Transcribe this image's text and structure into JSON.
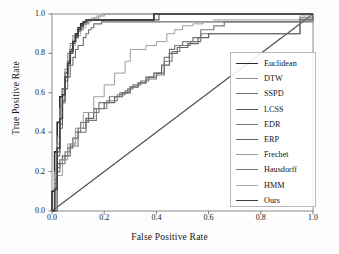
{
  "chart_data": {
    "type": "line",
    "title": "",
    "xlabel": "False Positive Rate",
    "ylabel": "True Positive Rate",
    "xlim": [
      0.0,
      1.0
    ],
    "ylim": [
      0.0,
      1.0
    ],
    "xticks": [
      "0.0",
      "0.2",
      "0.4",
      "0.6",
      "0.8",
      "1.0"
    ],
    "yticks": [
      "0.0",
      "0.2",
      "0.4",
      "0.6",
      "0.8",
      "1.0"
    ],
    "grid": false,
    "legend_position": "right",
    "reference_line": {
      "name": "chance-diagonal",
      "x": [
        0.0,
        1.0
      ],
      "y": [
        0.0,
        1.0
      ],
      "color": "#4a4a4a"
    },
    "series": [
      {
        "name": "Euclidean",
        "color": "#2b2b2b",
        "width": 1.6,
        "x": [
          0.0,
          0.0,
          0.01,
          0.01,
          0.02,
          0.02,
          0.03,
          0.03,
          0.04,
          0.05,
          0.06,
          0.07,
          0.08,
          0.09,
          0.1,
          0.11,
          0.12,
          0.13,
          0.14,
          0.38,
          0.39,
          1.0
        ],
        "y": [
          0.0,
          0.1,
          0.1,
          0.3,
          0.3,
          0.45,
          0.45,
          0.58,
          0.62,
          0.7,
          0.76,
          0.82,
          0.86,
          0.9,
          0.93,
          0.95,
          0.96,
          0.96,
          0.97,
          0.97,
          1.0,
          1.0
        ]
      },
      {
        "name": "DTW",
        "color": "#8d8d8d",
        "width": 1.1,
        "x": [
          0.0,
          0.01,
          0.02,
          0.03,
          0.04,
          0.05,
          0.06,
          0.07,
          0.08,
          0.1,
          0.12,
          0.14,
          0.16,
          0.18,
          0.2,
          0.24,
          1.0
        ],
        "y": [
          0.0,
          0.2,
          0.38,
          0.52,
          0.62,
          0.72,
          0.8,
          0.85,
          0.89,
          0.92,
          0.95,
          0.97,
          0.98,
          0.99,
          1.0,
          1.0,
          1.0
        ]
      },
      {
        "name": "SSPD",
        "color": "#6e6e6e",
        "width": 1.1,
        "x": [
          0.0,
          0.01,
          0.02,
          0.03,
          0.04,
          0.05,
          0.06,
          0.07,
          0.08,
          0.09,
          0.1,
          0.12,
          0.13,
          0.14,
          0.15,
          0.16,
          0.17,
          0.19,
          0.21,
          1.0
        ],
        "y": [
          0.0,
          0.12,
          0.28,
          0.42,
          0.55,
          0.62,
          0.68,
          0.74,
          0.78,
          0.82,
          0.84,
          0.88,
          0.9,
          0.92,
          0.93,
          0.95,
          0.95,
          0.96,
          0.96,
          0.96
        ]
      },
      {
        "name": "LCSS",
        "color": "#5a5a5a",
        "width": 1.1,
        "x": [
          0.0,
          0.01,
          0.02,
          0.03,
          0.04,
          0.05,
          0.06,
          0.07,
          0.08,
          0.09,
          0.1,
          0.11,
          0.12,
          0.13,
          0.4,
          0.41,
          1.0
        ],
        "y": [
          0.0,
          0.14,
          0.3,
          0.44,
          0.56,
          0.66,
          0.74,
          0.8,
          0.85,
          0.88,
          0.91,
          0.93,
          0.95,
          0.97,
          0.97,
          1.0,
          1.0
        ]
      },
      {
        "name": "EDR",
        "color": "#7a7a7a",
        "width": 1.2,
        "x": [
          0.0,
          0.02,
          0.03,
          0.05,
          0.07,
          0.09,
          0.11,
          0.14,
          0.18,
          0.22,
          0.26,
          0.29,
          0.31,
          0.34,
          0.37,
          0.4,
          0.43,
          0.45,
          0.47,
          0.5,
          0.54,
          0.57,
          0.62,
          0.66,
          0.95,
          1.0
        ],
        "y": [
          0.0,
          0.22,
          0.26,
          0.3,
          0.34,
          0.4,
          0.45,
          0.5,
          0.55,
          0.58,
          0.6,
          0.62,
          0.64,
          0.66,
          0.68,
          0.7,
          0.78,
          0.82,
          0.84,
          0.86,
          0.88,
          0.92,
          0.94,
          0.96,
          0.98,
          1.0
        ]
      },
      {
        "name": "ERP",
        "color": "#646464",
        "width": 1.2,
        "x": [
          0.0,
          0.01,
          0.02,
          0.04,
          0.06,
          0.08,
          0.1,
          0.13,
          0.16,
          0.2,
          0.24,
          0.27,
          0.3,
          0.33,
          0.36,
          0.39,
          0.42,
          0.45,
          0.48,
          0.52,
          0.56,
          0.6,
          0.95,
          1.0
        ],
        "y": [
          0.0,
          0.16,
          0.24,
          0.28,
          0.32,
          0.37,
          0.42,
          0.47,
          0.52,
          0.55,
          0.58,
          0.6,
          0.63,
          0.65,
          0.68,
          0.7,
          0.74,
          0.8,
          0.83,
          0.85,
          0.88,
          0.9,
          0.97,
          1.0
        ]
      },
      {
        "name": "Frechet",
        "color": "#9d9d9d",
        "width": 1.0,
        "x": [
          0.0,
          0.02,
          0.04,
          0.06,
          0.09,
          0.12,
          0.16,
          0.2,
          0.24,
          0.28,
          0.3,
          0.32,
          0.36,
          0.4,
          0.44,
          0.47,
          0.5,
          0.54,
          0.58,
          0.62,
          0.95,
          1.0
        ],
        "y": [
          0.0,
          0.18,
          0.26,
          0.34,
          0.42,
          0.5,
          0.58,
          0.64,
          0.7,
          0.76,
          0.82,
          0.82,
          0.84,
          0.86,
          0.9,
          0.92,
          0.94,
          0.95,
          0.96,
          0.97,
          0.99,
          1.0
        ]
      },
      {
        "name": "Hausdorff",
        "color": "#767676",
        "width": 1.1,
        "x": [
          0.0,
          0.02,
          0.03,
          0.05,
          0.07,
          0.1,
          0.13,
          0.17,
          0.21,
          0.25,
          0.28,
          0.3,
          0.33,
          0.36,
          0.4,
          0.43,
          0.46,
          0.49,
          0.53,
          0.57,
          0.95,
          1.0
        ],
        "y": [
          0.0,
          0.2,
          0.24,
          0.28,
          0.33,
          0.4,
          0.46,
          0.52,
          0.56,
          0.59,
          0.61,
          0.63,
          0.65,
          0.67,
          0.69,
          0.76,
          0.81,
          0.84,
          0.86,
          0.9,
          0.97,
          1.0
        ]
      },
      {
        "name": "HMM",
        "color": "#ababab",
        "width": 1.0,
        "x": [
          0.0,
          0.01,
          0.02,
          0.03,
          0.04,
          0.05,
          0.06,
          0.07,
          0.09,
          0.11,
          0.13,
          0.15,
          0.17,
          0.19,
          0.22,
          1.0
        ],
        "y": [
          0.0,
          0.18,
          0.34,
          0.48,
          0.6,
          0.7,
          0.78,
          0.84,
          0.89,
          0.93,
          0.96,
          0.98,
          0.99,
          1.0,
          1.0,
          1.0
        ]
      },
      {
        "name": "Ours",
        "color": "#3c3c3c",
        "width": 1.5,
        "x": [
          0.0,
          0.01,
          0.02,
          0.03,
          0.04,
          0.05,
          0.06,
          0.07,
          0.08,
          0.09,
          0.1,
          0.11,
          0.12,
          0.13,
          0.38,
          0.39,
          1.0
        ],
        "y": [
          0.0,
          0.11,
          0.32,
          0.47,
          0.59,
          0.68,
          0.75,
          0.81,
          0.86,
          0.89,
          0.92,
          0.94,
          0.96,
          0.97,
          0.97,
          1.0,
          1.0
        ]
      }
    ]
  },
  "legend": {
    "items": [
      {
        "label": "Euclidean"
      },
      {
        "label": "DTW"
      },
      {
        "label": "SSPD"
      },
      {
        "label": "LCSS"
      },
      {
        "label": "EDR"
      },
      {
        "label": "ERP"
      },
      {
        "label": "Frechet"
      },
      {
        "label": "Hausdorff"
      },
      {
        "label": "HMM"
      },
      {
        "label": "Ours"
      }
    ]
  }
}
